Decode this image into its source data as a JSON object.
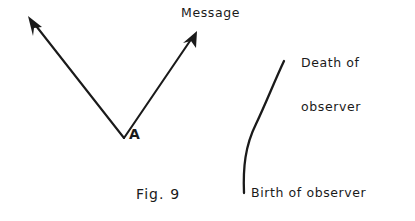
{
  "figure": {
    "caption": "Fig. 9",
    "background_color": "#ffffff",
    "ink_color": "#1a1a1a",
    "labels": {
      "message": "Message",
      "vertex": "A",
      "death_line1": "Death of",
      "death_line2": "observer",
      "birth": "Birth of observer"
    },
    "elements": {
      "left_ray_name": "left-message-ray",
      "right_ray_name": "right-message-ray",
      "worldline_name": "observer-worldline"
    }
  }
}
